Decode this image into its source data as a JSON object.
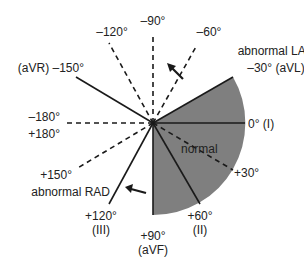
{
  "diagram": {
    "center": {
      "x": 153,
      "y": 123
    },
    "colors": {
      "shaded_sector": "#7f7f7f",
      "lines": "#1a1a1a",
      "text": "#222222",
      "background": "#ffffff"
    },
    "region_labels": {
      "normal": "normal",
      "abnormal_lad": "abnormal LAD",
      "abnormal_rad": "abnormal RAD"
    },
    "axes": [
      {
        "angle": -90,
        "style": "dashed",
        "label": "–90°"
      },
      {
        "angle": -120,
        "style": "dashed",
        "label": "–120°"
      },
      {
        "angle": -60,
        "style": "dashed",
        "label": "–60°"
      },
      {
        "angle": -150,
        "style": "solid",
        "label": "(aVR) –150°"
      },
      {
        "angle": -30,
        "style": "solid",
        "label": "–30° (aVL)"
      },
      {
        "angle": 0,
        "style": "solid",
        "label": "0° (I)"
      },
      {
        "angle": 30,
        "style": "dashed",
        "label": "+30°"
      },
      {
        "angle": 60,
        "style": "solid",
        "label": "+60°",
        "lead": "(II)"
      },
      {
        "angle": 90,
        "style": "solid",
        "label": "+90°",
        "lead": "(aVF)"
      },
      {
        "angle": 120,
        "style": "solid",
        "label": "+120°",
        "lead": "(III)"
      },
      {
        "angle": 150,
        "style": "dashed",
        "label": "+150°"
      },
      {
        "angle": 180,
        "style": "dashed",
        "label_neg": "–180°",
        "label_pos": "+180°"
      }
    ],
    "normal_range": {
      "from": -30,
      "to": 90
    }
  }
}
